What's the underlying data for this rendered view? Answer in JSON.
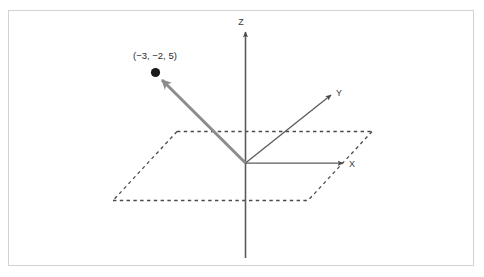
{
  "figure": {
    "background_color": "#ffffff",
    "frame_color": "#d2d2d2"
  },
  "axes": {
    "z": {
      "label": "Z",
      "color": "#5a5a5a"
    },
    "y": {
      "label": "Y",
      "color": "#5a5a5a"
    },
    "x": {
      "label": "X",
      "color": "#5a5a5a"
    }
  },
  "plane": {
    "name": "xy-plane",
    "style": "dotted",
    "color": "#4a4a4a"
  },
  "vector": {
    "label": "(−3, −2, 5)",
    "color": "#8c8c8c",
    "point_color": "#1a1a1a",
    "from": "origin",
    "components": {
      "x": -3,
      "y": -2,
      "z": 5
    }
  }
}
